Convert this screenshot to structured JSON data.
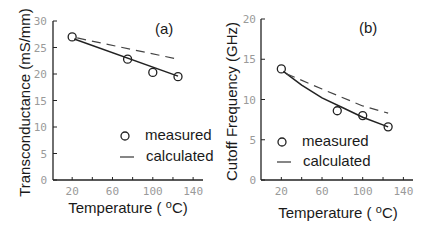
{
  "chart_data": [
    {
      "type": "line",
      "panel_label": "(a)",
      "title": "",
      "xlabel": "Temperature ( oC)",
      "xlabel_main": "Temperature (",
      "xlabel_sup": "o",
      "xlabel_unit": "C)",
      "ylabel": "Transconductance (mS/mm)",
      "xlim": [
        0,
        150
      ],
      "ylim": [
        0,
        30
      ],
      "xticks": [
        20,
        60,
        100,
        140
      ],
      "xticks_minor": [
        40,
        80,
        120
      ],
      "yticks": [
        0,
        5,
        10,
        15,
        20,
        25,
        30
      ],
      "grid": false,
      "legend_position": "lower right",
      "legend": [
        "measured",
        "calculated"
      ],
      "series": [
        {
          "name": "measured",
          "style": "open-circle markers",
          "x": [
            20,
            75,
            100,
            125
          ],
          "y": [
            27.0,
            22.8,
            20.3,
            19.5
          ]
        },
        {
          "name": "fit",
          "style": "solid line",
          "x": [
            22,
            125
          ],
          "y": [
            26.6,
            19.6
          ]
        },
        {
          "name": "calculated",
          "style": "dashed line",
          "x": [
            25,
            125
          ],
          "y": [
            26.8,
            22.8
          ]
        }
      ]
    },
    {
      "type": "line",
      "panel_label": "(b)",
      "title": "",
      "xlabel": "Temperature ( oC)",
      "xlabel_main": "Temperature (",
      "xlabel_sup": "o",
      "xlabel_unit": "C)",
      "ylabel": "Cutoff Frequency (GHz)",
      "xlim": [
        0,
        150
      ],
      "ylim": [
        0,
        20
      ],
      "xticks": [
        20,
        60,
        100,
        140
      ],
      "xticks_minor": [
        40,
        80,
        120
      ],
      "yticks": [
        0,
        5,
        10,
        15,
        20
      ],
      "grid": false,
      "legend_position": "lower left",
      "legend": [
        "measured",
        "calculated"
      ],
      "series": [
        {
          "name": "measured",
          "style": "open-circle markers",
          "x": [
            20,
            75,
            100,
            125
          ],
          "y": [
            13.8,
            8.6,
            8.0,
            6.6
          ]
        },
        {
          "name": "fit",
          "style": "solid line",
          "x": [
            22,
            40,
            60,
            80,
            100,
            125
          ],
          "y": [
            13.5,
            11.8,
            10.2,
            9.0,
            7.8,
            6.6
          ]
        },
        {
          "name": "calculated",
          "style": "dashed line",
          "x": [
            25,
            60,
            100,
            125
          ],
          "y": [
            13.2,
            11.3,
            9.2,
            8.3
          ]
        }
      ]
    }
  ]
}
